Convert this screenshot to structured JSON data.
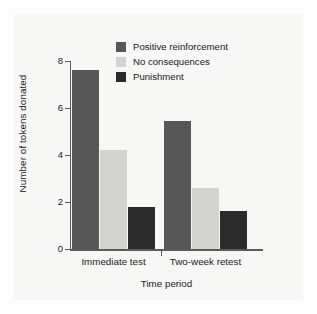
{
  "chart_data": {
    "type": "bar",
    "title": "",
    "subtitle": "",
    "xlabel": "Time period",
    "ylabel": "Number of tokens donated",
    "categories": [
      "Immediate test",
      "Two-week retest"
    ],
    "series": [
      {
        "name": "Positive reinforcement",
        "color": "#575757",
        "values": [
          7.6,
          5.45
        ]
      },
      {
        "name": "No consequences",
        "color": "#d3d3d1",
        "values": [
          4.2,
          2.6
        ]
      },
      {
        "name": "Punishment",
        "color": "#2b2b2b",
        "values": [
          1.8,
          1.6
        ]
      }
    ],
    "ylim": [
      0,
      8
    ],
    "yticks": [
      0,
      2,
      4,
      6,
      8
    ],
    "ytick_labels": [
      "0",
      "2",
      "4",
      "6",
      "8"
    ],
    "grid": false,
    "legend_position": "top-center"
  },
  "legend": {
    "items": [
      {
        "label": "Positive reinforcement",
        "swatch": "#575757"
      },
      {
        "label": "No consequences",
        "swatch": "#d3d3d1"
      },
      {
        "label": "Punishment",
        "swatch": "#2b2b2b"
      }
    ]
  },
  "colors": {
    "background": "#fdfdfd",
    "plot_background": "#f7f7f6",
    "axis": "#5b5b5b",
    "text": "#24201f"
  }
}
